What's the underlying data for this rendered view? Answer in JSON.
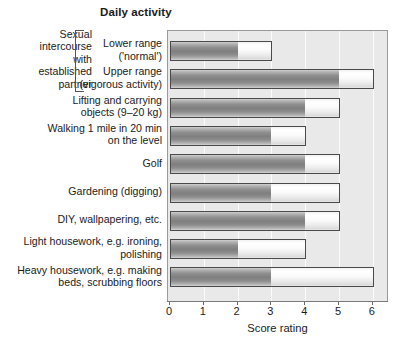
{
  "chart_data": {
    "type": "bar",
    "orientation": "horizontal",
    "title": "Daily activity",
    "xlabel": "Score rating",
    "ylabel": "",
    "xlim": [
      0,
      6
    ],
    "xticks": [
      0,
      1,
      2,
      3,
      4,
      5,
      6
    ],
    "xtick_labels": [
      "0",
      "1",
      "2",
      "3",
      "4",
      "5",
      "6"
    ],
    "grid": true,
    "legend": "none",
    "stacked": true,
    "categories": [
      "Lower range ('normal')",
      "Upper range (vigorous activity)",
      "Lifting and carrying objects (9–20 kg)",
      "Walking 1 mile in 20 min on the level",
      "Golf",
      "Gardening (digging)",
      "DIY, wallpapering, etc.",
      "Light housework, e.g. ironing, polishing",
      "Heavy housework, e.g. making beds, scrubbing floors"
    ],
    "series": [
      {
        "name": "lower-segment",
        "values": [
          2,
          5,
          4,
          3,
          4,
          3,
          4,
          2,
          3
        ]
      },
      {
        "name": "upper-segment",
        "values": [
          3,
          6,
          5,
          4,
          5,
          5,
          5,
          4,
          6
        ]
      }
    ],
    "bars": [
      {
        "label": "Lower range ('normal')",
        "dark_end": 2,
        "light_end": 3
      },
      {
        "label": "Upper range (vigorous activity)",
        "dark_end": 5,
        "light_end": 6
      },
      {
        "label": "Lifting and carrying objects (9–20 kg)",
        "dark_end": 4,
        "light_end": 5
      },
      {
        "label": "Walking 1 mile in 20 min on the level",
        "dark_end": 3,
        "light_end": 4
      },
      {
        "label": "Golf",
        "dark_end": 4,
        "light_end": 5
      },
      {
        "label": "Gardening (digging)",
        "dark_end": 3,
        "light_end": 5
      },
      {
        "label": "DIY, wallpapering, etc.",
        "dark_end": 4,
        "light_end": 5
      },
      {
        "label": "Light housework, e.g. ironing, polishing",
        "dark_end": 2,
        "light_end": 4
      },
      {
        "label": "Heavy housework, e.g. making beds, scrubbing floors",
        "dark_end": 3,
        "light_end": 6
      }
    ],
    "colors": {
      "plot_background": "#e9e9e9",
      "dark_segment": "#8a8a8a",
      "light_segment": "#f5f5f5",
      "bar_border": "#4a4a4a",
      "text": "#1b1b1b"
    }
  },
  "labels": {
    "rows": [
      {
        "line1": "Lower range",
        "line2": "('normal')"
      },
      {
        "line1": "Upper range",
        "line2": "(vigorous activity)"
      },
      {
        "line1": "Lifting and carrying",
        "line2": "objects (9–20 kg)"
      },
      {
        "line1": "Walking 1 mile in 20 min",
        "line2": "on the level"
      },
      {
        "line1": "Golf",
        "line2": ""
      },
      {
        "line1": "Gardening (digging)",
        "line2": ""
      },
      {
        "line1": "DIY, wallpapering, etc.",
        "line2": ""
      },
      {
        "line1": "Light housework, e.g. ironing,",
        "line2": "polishing"
      },
      {
        "line1": "Heavy housework, e.g. making",
        "line2": "beds, scrubbing floors"
      }
    ],
    "group": {
      "line1": "Sexual",
      "line2": "intercourse",
      "line3": "with",
      "line4": "established",
      "line5": "partner"
    }
  },
  "axis": {
    "title": "Score rating",
    "ticks": [
      "0",
      "1",
      "2",
      "3",
      "4",
      "5",
      "6"
    ]
  }
}
